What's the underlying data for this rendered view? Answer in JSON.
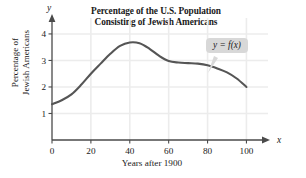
{
  "chart_data": {
    "type": "line",
    "title": "Percentage of the U.S. Population Consisting of Jewish Americans",
    "title_line1": "Percentage of the U.S. Population",
    "title_line2": "Consisting of Jewish Americans",
    "xlabel": "Years after 1900",
    "ylabel": "Percentage of Jewish Americans",
    "ylabel_line1": "Percentage of",
    "ylabel_line2": "Jewish Americans",
    "x_axis_name": "x",
    "y_axis_name": "y",
    "xlim": [
      0,
      108
    ],
    "ylim": [
      0,
      4.45
    ],
    "xticks": [
      0,
      20,
      40,
      60,
      80,
      100
    ],
    "xtick_labels": [
      "0",
      "20",
      "40",
      "60",
      "80",
      "100"
    ],
    "yticks": [
      1,
      2,
      3,
      4
    ],
    "ytick_labels": [
      "1",
      "2",
      "3",
      "4"
    ],
    "grid": true,
    "legend": "none",
    "annotation": "y = f(x)",
    "series": [
      {
        "name": "f(x)",
        "color": "#555555",
        "x": [
          0,
          5,
          10,
          15,
          20,
          25,
          30,
          35,
          40,
          45,
          50,
          55,
          60,
          65,
          70,
          75,
          80,
          85,
          90,
          95,
          100
        ],
        "values": [
          1.35,
          1.5,
          1.72,
          2.08,
          2.5,
          2.88,
          3.25,
          3.55,
          3.68,
          3.65,
          3.45,
          3.18,
          2.98,
          2.92,
          2.9,
          2.88,
          2.82,
          2.7,
          2.55,
          2.32,
          2.0
        ]
      }
    ]
  },
  "colors": {
    "curve": "#555555",
    "grid": "#ececec",
    "axis": "#4a4a4a",
    "callout_bg": "#d8d8d8"
  }
}
